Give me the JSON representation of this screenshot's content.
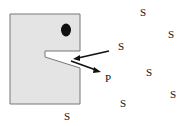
{
  "diagram": {
    "enzyme": {
      "fill": "#e4e4e4",
      "stroke": "#777777"
    },
    "substrate_label": "S",
    "product_label": "P",
    "labels": [
      {
        "text": "S",
        "x": 140,
        "y": 7
      },
      {
        "text": "S",
        "x": 168,
        "y": 29
      },
      {
        "text": "S",
        "x": 118,
        "y": 41
      },
      {
        "text": "P",
        "x": 105,
        "y": 73
      },
      {
        "text": "S",
        "x": 146,
        "y": 67
      },
      {
        "text": "S",
        "x": 170,
        "y": 89
      },
      {
        "text": "S",
        "x": 120,
        "y": 98
      },
      {
        "text": "S",
        "x": 64,
        "y": 111
      }
    ]
  }
}
